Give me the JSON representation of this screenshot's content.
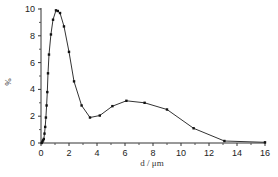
{
  "chart_data": {
    "type": "line",
    "title": "",
    "xlabel": "d / μm",
    "ylabel": "%",
    "xlim": [
      0,
      16
    ],
    "ylim": [
      0,
      10
    ],
    "xticks": [
      0,
      2,
      4,
      6,
      8,
      10,
      12,
      14,
      16
    ],
    "yticks": [
      0,
      2,
      4,
      6,
      8,
      10
    ],
    "grid": false,
    "legend": null,
    "series": [
      {
        "name": "distribution",
        "marker": "square",
        "color": "#333333",
        "x": [
          0.05,
          0.1,
          0.15,
          0.2,
          0.25,
          0.3,
          0.35,
          0.4,
          0.45,
          0.5,
          0.57,
          0.71,
          0.86,
          1.07,
          1.2,
          1.36,
          1.64,
          2.0,
          2.36,
          2.9,
          3.5,
          4.2,
          5.1,
          6.1,
          7.4,
          9.0,
          10.9,
          13.1,
          16.0
        ],
        "y": [
          0.0,
          0.1,
          0.2,
          0.3,
          0.7,
          1.2,
          1.9,
          2.8,
          3.8,
          5.2,
          6.6,
          8.1,
          9.2,
          9.9,
          9.85,
          9.7,
          8.7,
          6.8,
          4.6,
          2.8,
          1.9,
          2.05,
          2.75,
          3.15,
          3.0,
          2.5,
          1.1,
          0.15,
          0.05
        ]
      }
    ]
  }
}
